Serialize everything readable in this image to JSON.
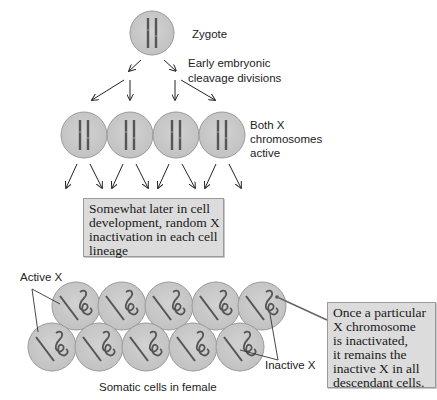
{
  "labels": {
    "zygote": "Zygote",
    "cleavage": [
      "Early embryonic",
      "cleavage divisions"
    ],
    "both_active": [
      "Both X",
      "chromosomes",
      "active"
    ],
    "active_x": "Active X",
    "inactive_x": "Inactive X",
    "somatic": "Somatic cells in female"
  },
  "boxes": {
    "random_inactivation": [
      "Somewhat later in cell",
      "development, random X",
      "inactivation in each cell",
      "lineage"
    ],
    "inheritance": [
      "Once a particular",
      "X chromosome",
      "is inactivated,",
      "it remains the",
      "inactive X in all",
      "descendant cells."
    ]
  },
  "colors": {
    "cell_fill": "#c8c8c8",
    "cell_stroke": "#9a9a9a",
    "chromosome": "#555555",
    "box_fill": "#dcdcdc",
    "arrow": "#222222"
  }
}
